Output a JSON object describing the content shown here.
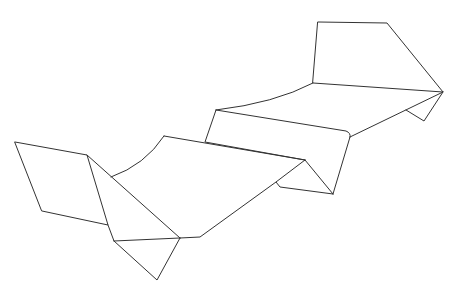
{
  "diagram": {
    "stroke_color": "#333333",
    "background_color": "#ffffff",
    "segments": [
      {
        "name": "left-flap",
        "d": "M15,142 L87,155 L108,225 L42,211 Z"
      },
      {
        "name": "left-flap-crease",
        "d": "M108,225 L114,241"
      },
      {
        "name": "left-diagonal",
        "d": "M87,155 L180,238"
      },
      {
        "name": "lower-fold-base",
        "d": "M114,241 L180,238"
      },
      {
        "name": "hanging-triangle",
        "d": "M114,241 L157,280 L180,238"
      },
      {
        "name": "front-curve",
        "d": "M111,177 Q145,165 164,136"
      },
      {
        "name": "front-top-edge",
        "d": "M164,136 L305,160"
      },
      {
        "name": "front-bottom-edge",
        "d": "M180,238 L200,237 L276,182"
      },
      {
        "name": "middle-fold-left",
        "d": "M305,160 L276,182 L280,187 L333,194"
      },
      {
        "name": "middle-fold-right",
        "d": "M305,160 L333,194"
      },
      {
        "name": "back-curve",
        "d": "M216,110 Q275,103 313,83"
      },
      {
        "name": "back-panel-left",
        "d": "M216,110 L205,142 L305,160"
      },
      {
        "name": "back-panel-top",
        "d": "M216,110 L346,131 Q351,133 350,137"
      },
      {
        "name": "back-panel-right",
        "d": "M350,137 L333,194"
      },
      {
        "name": "back-strip",
        "d": "M350,137 L443,92"
      },
      {
        "name": "top-flap",
        "d": "M318,22 L387,23 L443,92 L313,83 Z"
      },
      {
        "name": "right-small-triangle",
        "d": "M443,92 L424,121 L406,110"
      }
    ]
  }
}
